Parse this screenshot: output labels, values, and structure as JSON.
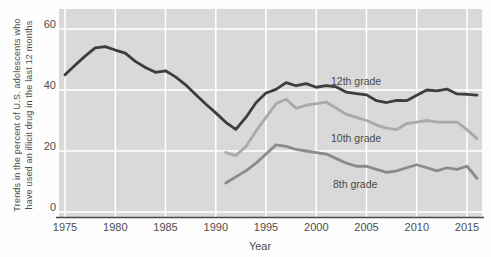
{
  "chart_data": {
    "type": "line",
    "xlabel": "Year",
    "ylabel": "Trends in the percent of U.S. adolescents who have used an illicit drug in the last 12 months",
    "ylabel_lines": [
      "Trends in the percent of U.S. adolescents who",
      "have used an illicit drug in the last 12 months"
    ],
    "x_ticks": [
      1975,
      1980,
      1985,
      1990,
      1995,
      2000,
      2005,
      2010,
      2015
    ],
    "y_ticks": [
      60,
      40,
      20,
      0
    ],
    "xlim": [
      1974.5,
      2016.5
    ],
    "ylim": [
      0,
      66
    ],
    "grid": true,
    "legend_position": "inline-annotations",
    "series": [
      {
        "name": "12th grade",
        "color": "#3d3d3d",
        "x": [
          1975,
          1976,
          1977,
          1978,
          1979,
          1980,
          1981,
          1982,
          1983,
          1984,
          1985,
          1986,
          1987,
          1988,
          1989,
          1990,
          1991,
          1992,
          1993,
          1994,
          1995,
          1996,
          1997,
          1998,
          1999,
          2000,
          2001,
          2002,
          2003,
          2004,
          2005,
          2006,
          2007,
          2008,
          2009,
          2010,
          2011,
          2012,
          2013,
          2014,
          2015,
          2016
        ],
        "values": [
          45.0,
          48.1,
          51.1,
          53.8,
          54.2,
          53.1,
          52.1,
          49.4,
          47.4,
          45.8,
          46.3,
          44.3,
          41.7,
          38.5,
          35.4,
          32.5,
          29.4,
          27.1,
          31.0,
          35.8,
          39.0,
          40.2,
          42.4,
          41.4,
          42.1,
          40.9,
          41.4,
          41.0,
          39.3,
          38.8,
          38.4,
          36.5,
          35.9,
          36.6,
          36.5,
          38.3,
          40.0,
          39.7,
          40.3,
          38.7,
          38.6,
          38.3
        ]
      },
      {
        "name": "10th grade",
        "color": "#a9a9a9",
        "x": [
          1991,
          1992,
          1993,
          1994,
          1995,
          1996,
          1997,
          1998,
          1999,
          2000,
          2001,
          2002,
          2003,
          2004,
          2005,
          2006,
          2007,
          2008,
          2009,
          2010,
          2011,
          2012,
          2013,
          2014,
          2015,
          2016
        ],
        "values": [
          19.5,
          18.5,
          21.5,
          26.5,
          31.0,
          35.5,
          37.0,
          34.0,
          35.0,
          35.5,
          36.0,
          34.0,
          32.0,
          31.0,
          30.0,
          28.5,
          27.5,
          27.0,
          29.0,
          29.5,
          30.0,
          29.5,
          29.5,
          29.5,
          27.0,
          24.0
        ]
      },
      {
        "name": "8th grade",
        "color": "#8a8a8a",
        "x": [
          1991,
          1992,
          1993,
          1994,
          1995,
          1996,
          1997,
          1998,
          1999,
          2000,
          2001,
          2002,
          2003,
          2004,
          2005,
          2006,
          2007,
          2008,
          2009,
          2010,
          2011,
          2012,
          2013,
          2014,
          2015,
          2016
        ],
        "values": [
          9.5,
          11.5,
          13.5,
          16.0,
          19.0,
          22.0,
          21.5,
          20.5,
          20.0,
          19.5,
          19.0,
          17.5,
          16.0,
          15.0,
          15.0,
          14.0,
          13.0,
          13.5,
          14.5,
          15.5,
          14.5,
          13.5,
          14.5,
          14.0,
          15.0,
          11.0
        ]
      }
    ],
    "colors": {
      "plot_bg": "#d9d9d9",
      "gridline": "#ffffff",
      "axis_line": "#4a4a4a",
      "text": "#4d4d4d",
      "page_bg": "#fdfdfd"
    }
  }
}
